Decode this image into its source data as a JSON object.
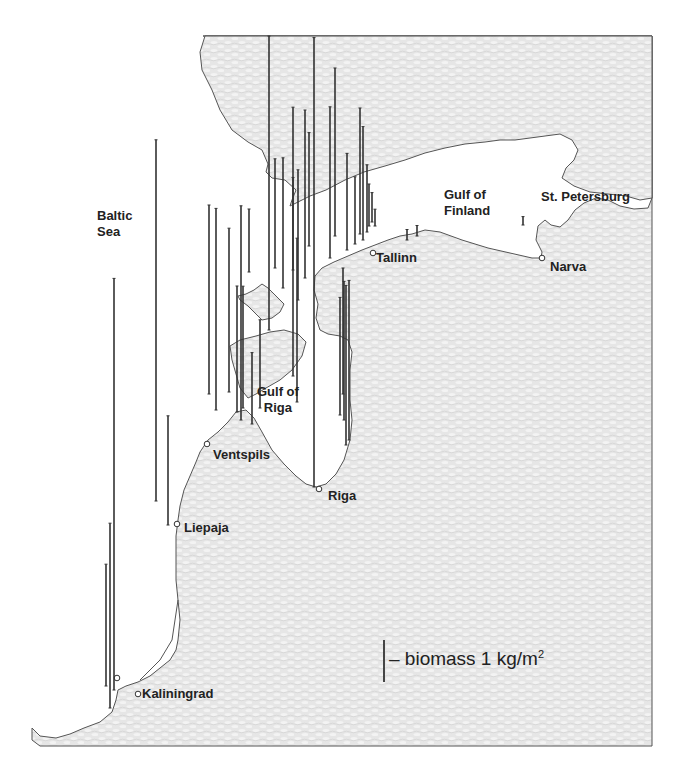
{
  "map": {
    "title": "",
    "sea_labels": {
      "baltic_sea": [
        "Baltic",
        "Sea"
      ],
      "gulf_of_finland": [
        "Gulf of",
        "Finland"
      ],
      "gulf_of_riga": [
        "Gulf of",
        "Riga"
      ]
    },
    "cities": [
      "Tallinn",
      "Narva",
      "St. Petersburg",
      "Ventspils",
      "Riga",
      "Liepaja",
      "Kaliningrad"
    ],
    "legend": {
      "text": "– biomass 1 kg/m",
      "superscript": "2",
      "unit_value_kg_m2": 1
    },
    "colors": {
      "land_fill": "#e4e4e4",
      "sea_fill": "#ffffff",
      "coast_stroke": "#555555",
      "bar_stroke": "#333333",
      "text": "#222222"
    }
  },
  "chart_data": {
    "type": "bar",
    "title": "",
    "legend": "biomass 1 kg/m²",
    "unit": "kg/m²",
    "stations": [
      {
        "region": "north-central",
        "biomass": 10.7
      },
      {
        "region": "saaremaa-west",
        "biomass": 7.0
      },
      {
        "region": "hiiumaa-north",
        "biomass": 1.5
      },
      {
        "region": "hiiumaa-north",
        "biomass": 2.6
      },
      {
        "region": "hiiumaa-north",
        "biomass": 3.1
      },
      {
        "region": "hiiumaa-north",
        "biomass": 2.2
      },
      {
        "region": "hiiumaa-north",
        "biomass": 3.1
      },
      {
        "region": "hiiumaa-north",
        "biomass": 4.0
      },
      {
        "region": "hiiumaa-north",
        "biomass": 2.7
      },
      {
        "region": "estonia-nw",
        "biomass": 3.6
      },
      {
        "region": "estonia-nw",
        "biomass": 4.0
      },
      {
        "region": "estonia-nw",
        "biomass": 2.3
      },
      {
        "region": "estonia-nw",
        "biomass": 1.6
      },
      {
        "region": "estonia-nw",
        "biomass": 3.0
      },
      {
        "region": "estonia-nw",
        "biomass": 2.7
      },
      {
        "region": "estonia-nw",
        "biomass": 1.6
      },
      {
        "region": "estonia-nw",
        "biomass": 1.0
      },
      {
        "region": "estonia-nw",
        "biomass": 0.7
      },
      {
        "region": "estonia-nw",
        "biomass": 0.4
      },
      {
        "region": "tallinn-east",
        "biomass": 0.25
      },
      {
        "region": "tallinn-east",
        "biomass": 0.25
      },
      {
        "region": "narva-bay",
        "biomass": 0.2
      },
      {
        "region": "saaremaa-west",
        "biomass": 4.5
      },
      {
        "region": "saaremaa-west",
        "biomass": 4.8
      },
      {
        "region": "saaremaa-west",
        "biomass": 3.9
      },
      {
        "region": "saaremaa-west",
        "biomass": 3.0
      },
      {
        "region": "saaremaa-west",
        "biomass": 2.9
      },
      {
        "region": "saaremaa-west",
        "biomass": 2.1
      },
      {
        "region": "saaremaa-west",
        "biomass": 1.7
      },
      {
        "region": "saaremaa-west",
        "biomass": 5.1
      },
      {
        "region": "gulf-of-riga",
        "biomass": 6.4
      },
      {
        "region": "gulf-of-riga",
        "biomass": 3.9
      },
      {
        "region": "gulf-of-riga-east",
        "biomass": 3.0
      },
      {
        "region": "gulf-of-riga-east",
        "biomass": 2.8
      },
      {
        "region": "gulf-of-riga-east",
        "biomass": 3.3
      },
      {
        "region": "gulf-of-riga-east",
        "biomass": 3.8
      },
      {
        "region": "gulf-of-riga-east",
        "biomass": 3.8
      },
      {
        "region": "latvia-west",
        "biomass": 8.6
      },
      {
        "region": "latvia-west",
        "biomass": 2.6
      },
      {
        "region": "lithuania-offshore",
        "biomass": 9.8
      },
      {
        "region": "kaliningrad",
        "biomass": 2.9
      },
      {
        "region": "kaliningrad",
        "biomass": 4.4
      }
    ]
  }
}
